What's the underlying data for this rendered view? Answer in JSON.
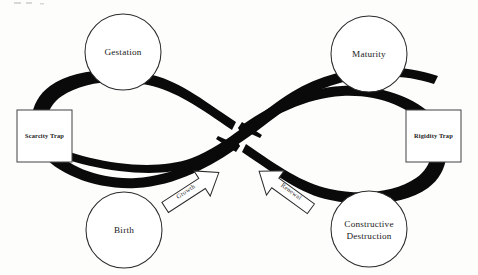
{
  "diagram": {
    "type": "infinity-lemniscate-cycle",
    "background_color": "#fdfdfc",
    "ribbon_color": "#0a0a0a",
    "node_fill_color": "#ffffff",
    "node_stroke_color": "#2b2b2b",
    "box_stroke_color": "#4a4a4a",
    "text_color": "#1a1a1a"
  },
  "nodes": [
    {
      "id": "gestation",
      "label": "Gestation",
      "shape": "circle",
      "cx": 123,
      "cy": 52,
      "r": 38
    },
    {
      "id": "maturity",
      "label": "Maturity",
      "shape": "circle",
      "cx": 369,
      "cy": 54,
      "r": 38
    },
    {
      "id": "birth",
      "label": "Birth",
      "shape": "circle",
      "cx": 124,
      "cy": 230,
      "r": 38
    },
    {
      "id": "constructive-destruction",
      "label": "Constructive Destruction",
      "label_line1": "Constructive",
      "label_line2": "Destruction",
      "shape": "circle",
      "cx": 369,
      "cy": 229,
      "r": 38
    }
  ],
  "traps": [
    {
      "id": "scarcity-trap",
      "label": "Scarcity Trap",
      "shape": "square",
      "x": 17,
      "y": 110,
      "w": 55,
      "h": 52
    },
    {
      "id": "rigidity-trap",
      "label": "Rigidity Trap",
      "shape": "square",
      "x": 406,
      "y": 110,
      "w": 55,
      "h": 52
    }
  ],
  "arrows": [
    {
      "id": "growth-arrow",
      "label": "Growth",
      "direction": "up-right",
      "rotation_deg": -33,
      "label_x": 192,
      "label_y": 190
    },
    {
      "id": "renewal-arrow",
      "label": "Renewal",
      "direction": "up-left",
      "rotation_deg": 36,
      "label_x": 285,
      "label_y": 190
    }
  ]
}
